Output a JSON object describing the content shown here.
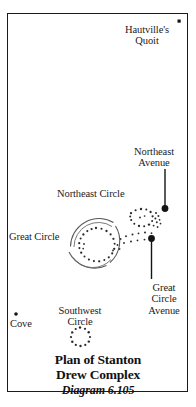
{
  "figure": {
    "title_main": "Plan of Stanton\nDrew Complex",
    "title_sub": "Diagram 6.105",
    "frame_color": "#1b1b1b",
    "ink_color": "#1b1b1b",
    "background": "#ffffff"
  },
  "map": {
    "labels": {
      "hautvilles_quoit": "Hautville's\nQuoit",
      "northeast_avenue": "Northeast\nAvenue",
      "northeast_circle": "Northeast Circle",
      "great_circle": "Great Circle",
      "great_circle_avenue": "Great\nCircle\nAvenue",
      "southwest_circle": "Southwest\nCircle",
      "cove": "Cove"
    },
    "features": [
      {
        "name": "hautvilles-quoit",
        "kind": "point-marker",
        "shape": "square",
        "label": "Hautville's Quoit"
      },
      {
        "name": "northeast-avenue",
        "kind": "leader-line",
        "marker": "filled-dot",
        "label": "Northeast Avenue"
      },
      {
        "name": "northeast-circle",
        "kind": "stone-circle",
        "label": "Northeast Circle"
      },
      {
        "name": "great-circle",
        "kind": "stone-circle",
        "label": "Great Circle"
      },
      {
        "name": "great-circle-avenue",
        "kind": "leader-line",
        "marker": "filled-dot",
        "label": "Great Circle Avenue"
      },
      {
        "name": "southwest-circle",
        "kind": "stone-circle",
        "label": "Southwest Circle"
      },
      {
        "name": "cove",
        "kind": "point-marker",
        "shape": "dot",
        "label": "Cove"
      }
    ]
  }
}
